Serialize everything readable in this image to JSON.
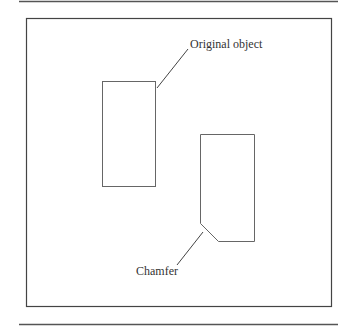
{
  "figure": {
    "labels": {
      "original": "Original object",
      "chamfer": "Chamfer"
    },
    "colors": {
      "line": "#444444",
      "shape": "#666666",
      "text": "#333333"
    }
  }
}
